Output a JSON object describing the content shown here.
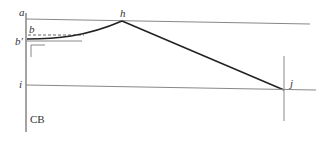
{
  "diagram": {
    "labels": {
      "a": "a",
      "h": "h",
      "b": "b",
      "b_prime": "b′",
      "i": "i",
      "j": "j",
      "cb": "CB"
    },
    "colors": {
      "thin_line": "#888888",
      "thick_line": "#222222",
      "text": "#333333"
    }
  }
}
